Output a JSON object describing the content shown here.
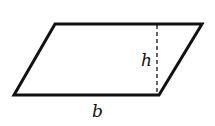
{
  "diagram": {
    "type": "parallelogram",
    "vertices": {
      "top_left": [
        55,
        24
      ],
      "top_right": [
        202,
        24
      ],
      "bottom_right": [
        159,
        95
      ],
      "bottom_left": [
        14,
        95
      ]
    },
    "height_line": {
      "x": 157,
      "y1": 24,
      "y2": 95,
      "style": "dashed"
    },
    "labels": {
      "height": "h",
      "base": "b"
    },
    "stroke_color": "#111111"
  }
}
